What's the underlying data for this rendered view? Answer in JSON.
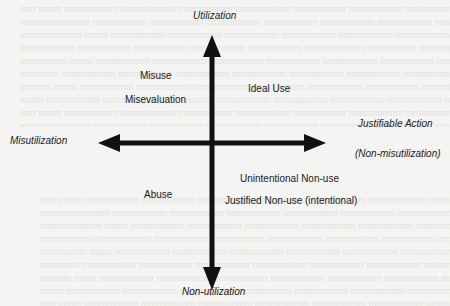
{
  "background": {
    "bleed_through_color": "#e3e3e0",
    "paper_color": "#f4f4f2"
  },
  "diagram": {
    "type": "quadrant-axes",
    "axis_color": "#111111",
    "axes": {
      "top": "Utilization",
      "bottom": "Non-utilization",
      "left": "Misutilization",
      "right": "Justifiable Action",
      "right_sub": "(Non-misutilization)"
    },
    "quadrants": {
      "upper_left": [
        "Misuse",
        "Misevaluation"
      ],
      "upper_right": [
        "Ideal Use"
      ],
      "lower_left": [
        "Abuse"
      ],
      "lower_right": [
        "Unintentional Non-use",
        "Justified Non-use (intentional)"
      ]
    }
  }
}
